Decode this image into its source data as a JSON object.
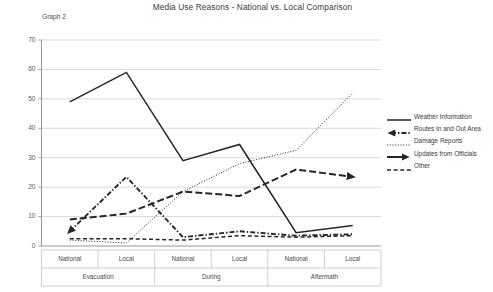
{
  "graph_label": "Graph 2",
  "chart_data": {
    "type": "line",
    "title": "Media Use Reasons - National vs. Local Comparison",
    "xlabel": "",
    "ylabel": "",
    "ylim": [
      0,
      70
    ],
    "yticks": [
      0,
      10,
      20,
      30,
      40,
      50,
      60,
      70
    ],
    "grid": true,
    "legend_position": "right",
    "categories": [
      "National",
      "Local",
      "National",
      "Local",
      "National",
      "Local"
    ],
    "groups": [
      {
        "label": "Evacuation",
        "categories": [
          "National",
          "Local"
        ]
      },
      {
        "label": "During",
        "categories": [
          "National",
          "Local"
        ]
      },
      {
        "label": "Aftermath",
        "categories": [
          "National",
          "Local"
        ]
      }
    ],
    "series": [
      {
        "name": "Weather Information",
        "style": "solid",
        "values": [
          49,
          59,
          29,
          34.5,
          4.5,
          7
        ]
      },
      {
        "name": "Routes In and Out Area",
        "style": "dash-dot",
        "values": [
          5,
          23.5,
          3,
          5,
          3.5,
          4
        ]
      },
      {
        "name": "Damage Reports",
        "style": "dotted",
        "values": [
          2,
          1,
          18.5,
          28,
          32.5,
          52
        ]
      },
      {
        "name": "Updates from Officials",
        "style": "long-dash",
        "values": [
          9,
          11,
          18.5,
          17,
          26,
          23.5
        ]
      },
      {
        "name": "Other",
        "style": "dashed",
        "values": [
          2.5,
          2.5,
          2,
          3.5,
          3,
          3.5
        ]
      }
    ]
  },
  "legend": {
    "items": [
      {
        "label": "Weather Information",
        "style": "solid"
      },
      {
        "label": "Routes In and Out Area",
        "style": "dash-dot"
      },
      {
        "label": "Damage Reports",
        "style": "dotted"
      },
      {
        "label": "Updates from Officials",
        "style": "long-dash"
      },
      {
        "label": "Other",
        "style": "dashed"
      }
    ]
  },
  "colors": {
    "line": "#262626",
    "grid": "#c9c9c9",
    "axis": "#8a8a8a",
    "text": "#3b3b3b"
  }
}
